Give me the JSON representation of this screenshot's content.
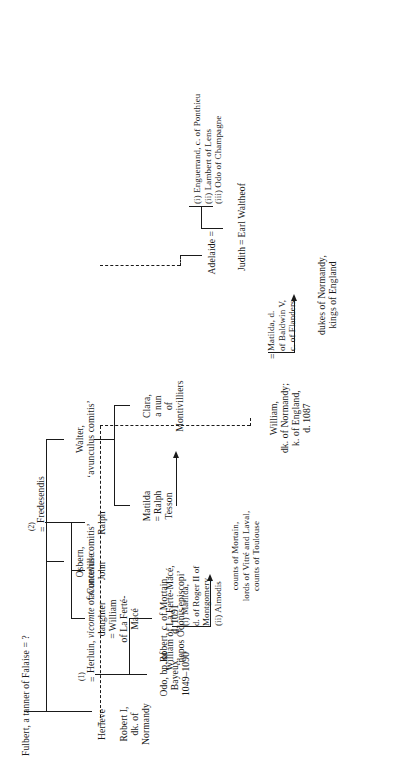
{
  "chart": {
    "type": "genealogy-tree",
    "title": "Fulbert, a tanner of Falaise = ?",
    "orientation": "rotated-90",
    "nodes": {
      "fulbert": "Fulbert, a tanner of Falaise = ?",
      "herleve": "Herleve",
      "herluin_name": "Herluin, ",
      "herluin_title": "vicomte",
      "herluin_place": " of Conteville",
      "fredesendis": "Fredesendis",
      "robert_i": "Robert I,\ndk. of\nNormandy",
      "odo": "Odo, bp. of\nBayeux,\n1049–1090",
      "robert_mortain": "Robert, c. of Mortain,\nd. 1091",
      "robert_wife1": "(i) Matilda,\nd. of Roger II of\nMontgomery",
      "robert_wife2": "(ii) Almodis",
      "mortain_desc": "counts of Mortain,\nlords of Vitré and Laval,\ncounts of Toulouse",
      "ralph": "Ralph",
      "john": "John",
      "daughter": "daughter\n= William\nof La Ferté-\nMacé",
      "william_ferte": "William of La Ferté-Macé,\n‘nepos Odonis episcopi’",
      "osbern": "Osbern,\n‘avunculus comitis’",
      "walter": "Walter,\n‘avunculus comitis’",
      "matilda_tesson": "Matilda\n= Ralph\nTesson",
      "clara": "Clara,\na nun\nof\nMontivilliers",
      "william_conq": "William,\ndk. of Normandy;\nk. of England,\nd. 1087",
      "matilda_flanders": "Matilda, d.\nof Baldwin V,\nc. of Flanders",
      "dukes": "dukes of Normandy,\nkings of England",
      "adelaide": "Adelaide =",
      "adelaide_husbands": "(i)  Enguerrand, c. of Ponthieu\n(ii)  Lambert of Lens\n(iii) Odo of Champagne",
      "judith": "Judith = Earl Waltheof"
    },
    "marriage_markers": {
      "herleve_first": "(1)",
      "fredesendis_second": "(2)",
      "herleve_equals": "=",
      "fredesendis_equals": "=",
      "robert_i_equals": "=",
      "robert_mortain_equals": "=",
      "william_equals": "=",
      "daughter_equals": "="
    },
    "colors": {
      "ink": "#1a1a1a",
      "paper": "#ffffff"
    }
  }
}
